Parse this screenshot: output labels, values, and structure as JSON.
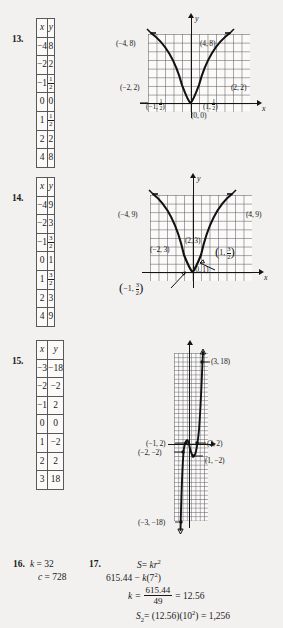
{
  "page": {
    "background": "#f2f1ef",
    "ink": "#1a1a1a"
  },
  "problems": [
    {
      "number": "13.",
      "table": {
        "headers": [
          "x",
          "y"
        ],
        "rows": [
          [
            "−4",
            "8"
          ],
          [
            "−2",
            "2"
          ],
          [
            "−1",
            "1/2"
          ],
          [
            "0",
            "0"
          ],
          [
            "1",
            "1/2"
          ],
          [
            "2",
            "2"
          ],
          [
            "4",
            "8"
          ]
        ]
      },
      "graph": {
        "axis_x_label": "x",
        "axis_y_label": "y",
        "point_labels": [
          "(−4, 8)",
          "(4, 8)",
          "(−2, 2)",
          "(2, 2)",
          "(0, 0)"
        ],
        "frac_labels": [
          {
            "pre": "(−1, ",
            "num": "1",
            "den": "2",
            "post": ")"
          },
          {
            "pre": "(1, ",
            "num": "1",
            "den": "2",
            "post": ")"
          }
        ]
      }
    },
    {
      "number": "14.",
      "table": {
        "headers": [
          "x",
          "y"
        ],
        "rows": [
          [
            "−4",
            "9"
          ],
          [
            "−2",
            "3"
          ],
          [
            "−1",
            "3/2"
          ],
          [
            "0",
            "1"
          ],
          [
            "1",
            "3/2"
          ],
          [
            "2",
            "3"
          ],
          [
            "4",
            "9"
          ]
        ]
      },
      "graph": {
        "axis_x_label": "x",
        "axis_y_label": "y",
        "point_labels": [
          "(−4, 9)",
          "(4, 9)",
          "(−2, 3)",
          "(2, 3)",
          "(0, 1)"
        ],
        "frac_labels": [
          {
            "pre": "(1, ",
            "num": "3",
            "den": "2",
            "post": ")"
          },
          {
            "pre": "(−1, ",
            "num": "3",
            "den": "2",
            "post": ")"
          }
        ]
      }
    },
    {
      "number": "15.",
      "table": {
        "headers": [
          "x",
          "y"
        ],
        "rows": [
          [
            "−3",
            "−18"
          ],
          [
            "−2",
            "−2"
          ],
          [
            "−1",
            "2"
          ],
          [
            "0",
            "0"
          ],
          [
            "1",
            "−2"
          ],
          [
            "2",
            "2"
          ],
          [
            "3",
            "18"
          ]
        ]
      },
      "graph": {
        "point_labels": [
          "(3, 18)",
          "(−1, 2)",
          "(2, 2)",
          "(−2, −2)",
          "(1, −2)",
          "(−3, −18)"
        ]
      }
    }
  ],
  "answers": {
    "q16": {
      "number": "16.",
      "line1_var": "k",
      "line1_val": "= 32",
      "line2_var": "c",
      "line2_val": "= 728"
    },
    "q17": {
      "number": "17.",
      "line1": "S = kr²",
      "line1_lhs": "S",
      "line1_rhs_pre": "= ",
      "line1_rhs_k": "k",
      "line1_rhs_r": "r",
      "line1_rhs_exp": "2",
      "line2_pre": "615.44 − ",
      "line2_k": "k",
      "line2_open": "(7",
      "line2_exp": "2",
      "line2_close": ")",
      "line3_k": "k",
      "line3_eq": "=",
      "line3_num": "615.44",
      "line3_den": "49",
      "line3_result": "= 12.56",
      "line4_S": "S",
      "line4_sub": "2",
      "line4_rest_a": "= (12.56)(10",
      "line4_exp": "2",
      "line4_rest_b": ") = 1,256"
    }
  }
}
